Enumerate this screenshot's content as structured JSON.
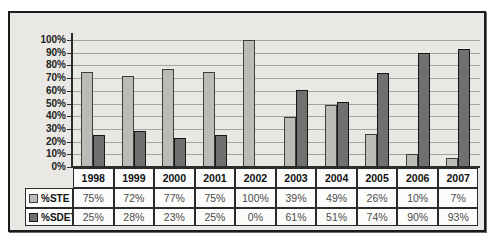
{
  "chart_data": {
    "type": "bar",
    "title": "",
    "xlabel": "",
    "ylabel": "",
    "categories": [
      "1998",
      "1999",
      "2000",
      "2001",
      "2002",
      "2003",
      "2004",
      "2005",
      "2006",
      "2007"
    ],
    "series": [
      {
        "name": "%STE",
        "values": [
          75,
          72,
          77,
          75,
          100,
          39,
          49,
          26,
          10,
          7
        ],
        "color": "#bcbbb8",
        "border_color": "#3f3f3f"
      },
      {
        "name": "%SDET",
        "values": [
          25,
          28,
          23,
          25,
          0,
          61,
          51,
          74,
          90,
          93
        ],
        "color": "#71706e",
        "border_color": "#161616"
      }
    ],
    "ylim": [
      0,
      100
    ],
    "ytick_labels": [
      "100%",
      "90%",
      "80%",
      "70%",
      "60%",
      "50%",
      "40%",
      "30%",
      "20%",
      "10%",
      "0%"
    ],
    "value_suffix": "%",
    "grid": true,
    "data_table": true,
    "legend_position": "data-table-left",
    "colors": {
      "frame_border": "#1b1b1b",
      "chart_background": "#e9e8e5",
      "gridline": "#a3a3a1",
      "axis": "#2c2c2c",
      "cell_background": "#fcfcfb",
      "cell_border": "#2b2b2b",
      "year_text": "#111111",
      "value_text": "#4a4a4a"
    }
  }
}
